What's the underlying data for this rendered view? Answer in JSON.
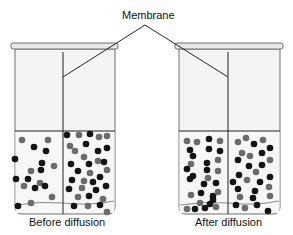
{
  "diagram": {
    "title_label": "Membrane",
    "beakers": [
      {
        "name": "before",
        "caption": "Before diffusion",
        "x": 12,
        "width": 105,
        "membrane_x": 63,
        "dots": [
          [
            22,
            140,
            "g"
          ],
          [
            15,
            159,
            "k"
          ],
          [
            34,
            147,
            "k"
          ],
          [
            48,
            140,
            "g"
          ],
          [
            46,
            151,
            "k"
          ],
          [
            42,
            163,
            "k"
          ],
          [
            31,
            171,
            "g"
          ],
          [
            16,
            179,
            "k"
          ],
          [
            28,
            179,
            "k"
          ],
          [
            41,
            170,
            "k"
          ],
          [
            40,
            183,
            "g"
          ],
          [
            54,
            166,
            "g"
          ],
          [
            24,
            186,
            "g"
          ],
          [
            35,
            188,
            "k"
          ],
          [
            45,
            186,
            "k"
          ],
          [
            52,
            197,
            "g"
          ],
          [
            18,
            206,
            "k"
          ],
          [
            31,
            203,
            "g"
          ],
          [
            67,
            135,
            "k"
          ],
          [
            79,
            135,
            "g"
          ],
          [
            90,
            134,
            "k"
          ],
          [
            99,
            137,
            "g"
          ],
          [
            107,
            136,
            "g"
          ],
          [
            70,
            146,
            "g"
          ],
          [
            86,
            144,
            "k"
          ],
          [
            75,
            151,
            "g"
          ],
          [
            98,
            151,
            "k"
          ],
          [
            107,
            148,
            "k"
          ],
          [
            84,
            157,
            "g"
          ],
          [
            71,
            164,
            "k"
          ],
          [
            89,
            164,
            "k"
          ],
          [
            98,
            161,
            "g"
          ],
          [
            104,
            162,
            "k"
          ],
          [
            78,
            171,
            "k"
          ],
          [
            90,
            173,
            "g"
          ],
          [
            107,
            170,
            "g"
          ],
          [
            72,
            180,
            "k"
          ],
          [
            84,
            181,
            "g"
          ],
          [
            100,
            177,
            "k"
          ],
          [
            93,
            182,
            "k"
          ],
          [
            69,
            189,
            "k"
          ],
          [
            82,
            188,
            "g"
          ],
          [
            96,
            190,
            "k"
          ],
          [
            106,
            186,
            "k"
          ],
          [
            78,
            197,
            "g"
          ],
          [
            89,
            196,
            "k"
          ],
          [
            103,
            199,
            "g"
          ],
          [
            74,
            206,
            "k"
          ],
          [
            88,
            206,
            "g"
          ],
          [
            100,
            205,
            "k"
          ],
          [
            107,
            212,
            "g"
          ]
        ]
      },
      {
        "name": "after",
        "caption": "After diffusion",
        "x": 176,
        "width": 106,
        "membrane_x": 228,
        "dots": [
          [
            187,
            141,
            "g"
          ],
          [
            197,
            142,
            "g"
          ],
          [
            209,
            139,
            "k"
          ],
          [
            220,
            141,
            "g"
          ],
          [
            190,
            150,
            "k"
          ],
          [
            209,
            149,
            "k"
          ],
          [
            193,
            156,
            "k"
          ],
          [
            220,
            151,
            "k"
          ],
          [
            191,
            164,
            "g"
          ],
          [
            207,
            163,
            "k"
          ],
          [
            218,
            160,
            "g"
          ],
          [
            187,
            169,
            "k"
          ],
          [
            207,
            170,
            "k"
          ],
          [
            193,
            176,
            "k"
          ],
          [
            208,
            178,
            "g"
          ],
          [
            218,
            171,
            "g"
          ],
          [
            190,
            179,
            "k"
          ],
          [
            204,
            184,
            "k"
          ],
          [
            216,
            183,
            "k"
          ],
          [
            191,
            195,
            "g"
          ],
          [
            201,
            193,
            "k"
          ],
          [
            213,
            196,
            "k"
          ],
          [
            218,
            192,
            "g"
          ],
          [
            200,
            203,
            "g"
          ],
          [
            213,
            200,
            "k"
          ],
          [
            187,
            209,
            "g"
          ],
          [
            195,
            209,
            "k"
          ],
          [
            205,
            208,
            "k"
          ],
          [
            210,
            204,
            "k"
          ],
          [
            216,
            207,
            "g"
          ],
          [
            238,
            142,
            "g"
          ],
          [
            246,
            138,
            "g"
          ],
          [
            254,
            144,
            "k"
          ],
          [
            263,
            140,
            "g"
          ],
          [
            270,
            148,
            "k"
          ],
          [
            242,
            153,
            "g"
          ],
          [
            250,
            156,
            "g"
          ],
          [
            262,
            153,
            "k"
          ],
          [
            238,
            160,
            "k"
          ],
          [
            270,
            160,
            "g"
          ],
          [
            262,
            165,
            "k"
          ],
          [
            249,
            166,
            "k"
          ],
          [
            256,
            172,
            "g"
          ],
          [
            239,
            175,
            "k"
          ],
          [
            270,
            177,
            "k"
          ],
          [
            233,
            182,
            "k"
          ],
          [
            247,
            180,
            "g"
          ],
          [
            260,
            182,
            "k"
          ],
          [
            238,
            189,
            "k"
          ],
          [
            255,
            191,
            "k"
          ],
          [
            269,
            187,
            "g"
          ],
          [
            240,
            197,
            "g"
          ],
          [
            253,
            198,
            "k"
          ],
          [
            270,
            196,
            "g"
          ],
          [
            236,
            205,
            "k"
          ],
          [
            245,
            208,
            "g"
          ],
          [
            257,
            205,
            "k"
          ],
          [
            268,
            211,
            "k"
          ]
        ]
      }
    ],
    "colors": {
      "dark_dot": "#141414",
      "gray_dot": "#6b6b6b",
      "glass": "#f3f3f3",
      "outline": "#6e6e6e",
      "water_line": "#222222"
    }
  }
}
